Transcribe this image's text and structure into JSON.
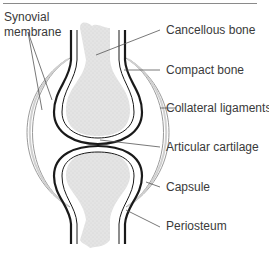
{
  "diagram": {
    "labels": {
      "synovial_membrane": "Synovial membrane",
      "cancellous_bone": "Cancellous bone",
      "compact_bone": "Compact bone",
      "collateral_ligaments": "Collateral ligaments",
      "articular_cartilage": "Articular cartilage",
      "capsule": "Capsule",
      "periosteum": "Periosteum"
    },
    "colors": {
      "bone_fill": "#e2e2e2",
      "outline": "#1a1a1a",
      "leader_line": "#555555",
      "text": "#3a3a3a",
      "capsule_gray": "#bdbdbd"
    }
  }
}
